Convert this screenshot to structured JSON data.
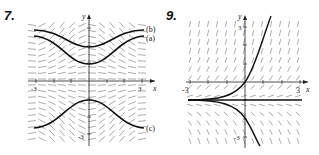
{
  "figures": [
    {
      "number": "7.",
      "axes": {
        "x_label": "x",
        "y_label": "y",
        "x_min_tick": "-3",
        "x_max_tick": "3",
        "y_min_tick": "-3"
      },
      "curve_labels": [
        "(b)",
        "(a)",
        "(c)"
      ],
      "description": "Slope field with three solution curves (b), (a) above x-axis, (c) below"
    },
    {
      "number": "9.",
      "axes": {
        "x_label": "x",
        "y_label": "y",
        "x_min_tick": "-3",
        "x_max_tick": "3",
        "y_max_tick": "3",
        "y_min_tick": "-3"
      },
      "description": "Slope field with exponential solution curves and horizontal equilibrium line"
    }
  ],
  "colors": {
    "ink": "#222222",
    "field": "#777777",
    "background": "#ffffff"
  }
}
